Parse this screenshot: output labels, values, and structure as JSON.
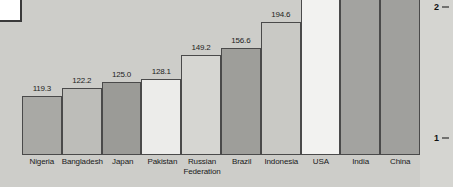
{
  "chart_data": {
    "type": "bar",
    "title": "",
    "subtitle": "",
    "xlabel": "",
    "ylabel": "",
    "categories": [
      "Nigeria",
      "Bangladesh",
      "Japan",
      "Pakistan",
      "Russian Federation",
      "Brazil",
      "Indonesia",
      "USA",
      "India",
      "China"
    ],
    "values": [
      119.3,
      122.2,
      125.0,
      128.1,
      149.2,
      156.6,
      194.6,
      null,
      null,
      null
    ],
    "value_labels": [
      "119.3",
      "122.2",
      "125.0",
      "128.1",
      "149.2",
      "156.6",
      "194.6",
      "",
      "",
      ""
    ],
    "bar_colors": [
      "#a9a9a5",
      "#bdbdb9",
      "#9b9b97",
      "#ececea",
      "#d6d6d2",
      "#9e9e9a",
      "#c9c9c5",
      "#f2f2f0",
      "#a3a3a0",
      "#a0a09d"
    ],
    "bar_pixel_heights": [
      68,
      78,
      84,
      88,
      116,
      124,
      154,
      200,
      214,
      214
    ],
    "yticks": [
      "1",
      "2"
    ],
    "ytick_positions_pct": [
      74,
      4
    ],
    "grid": false,
    "legend": null
  },
  "axis": {
    "tick_1": "1",
    "tick_2": "2"
  }
}
